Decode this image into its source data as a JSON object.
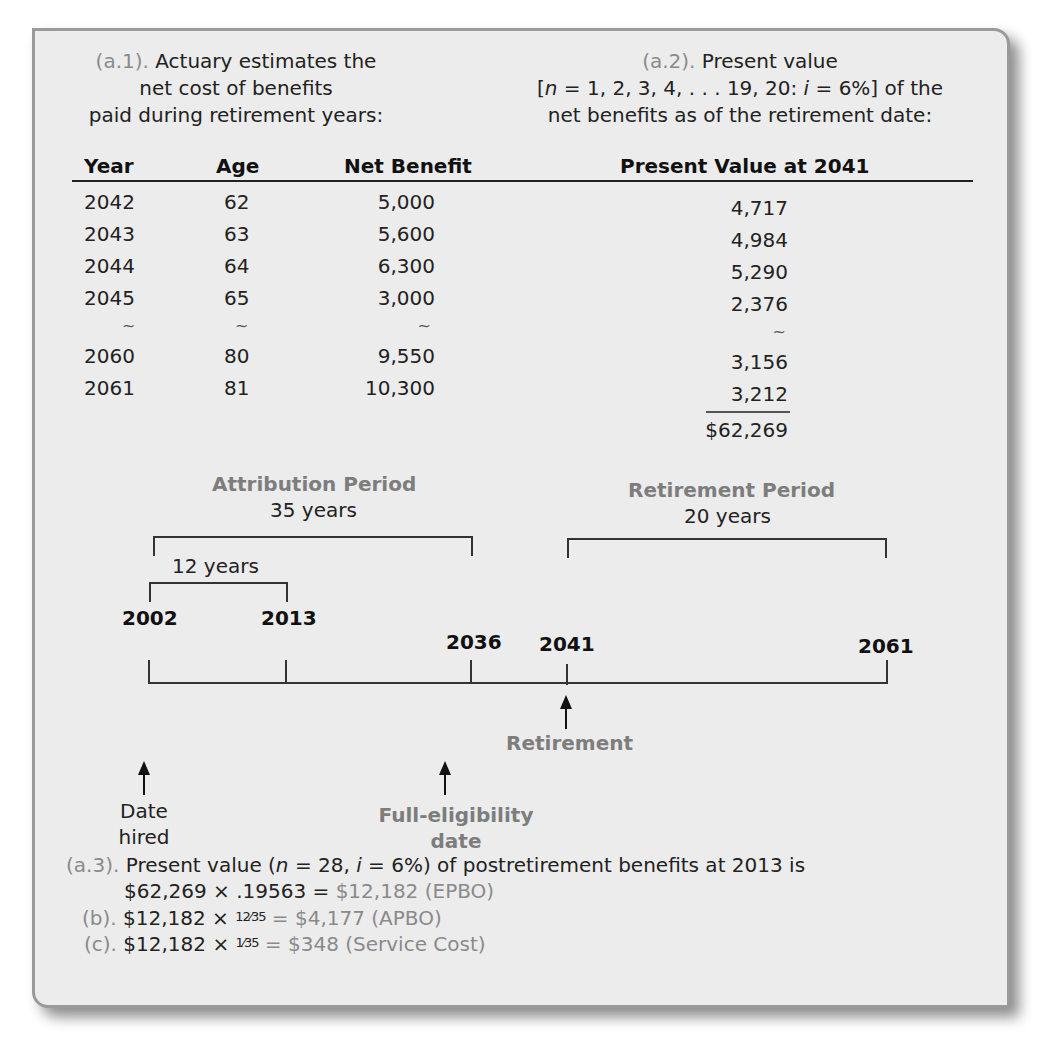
{
  "section_a1": {
    "label": "(a.1).",
    "lines": [
      "Actuary estimates the",
      "net cost of benefits",
      "paid during retirement years:"
    ]
  },
  "section_a2": {
    "label": "(a.2).",
    "line1": "Present value",
    "line2_prefix": "[",
    "line2_n": "n",
    "line2_mid": " = 1, 2, 3, 4, . . . 19, 20: ",
    "line2_i": "i",
    "line2_suffix": " = 6%] of the",
    "line3": "net benefits as of the retirement date:"
  },
  "table": {
    "headers": {
      "year": "Year",
      "age": "Age",
      "net_benefit": "Net Benefit",
      "present_value": "Present Value at 2041"
    },
    "rows": [
      {
        "year": "2042",
        "age": "62",
        "net_benefit": "5,000",
        "present_value": "4,717"
      },
      {
        "year": "2043",
        "age": "63",
        "net_benefit": "5,600",
        "present_value": "4,984"
      },
      {
        "year": "2044",
        "age": "64",
        "net_benefit": "6,300",
        "present_value": "5,290"
      },
      {
        "year": "2045",
        "age": "65",
        "net_benefit": "3,000",
        "present_value": "2,376"
      },
      {
        "year": "~",
        "age": "~",
        "net_benefit": "~",
        "present_value": "~"
      },
      {
        "year": "2060",
        "age": "80",
        "net_benefit": "9,550",
        "present_value": "3,156"
      },
      {
        "year": "2061",
        "age": "81",
        "net_benefit": "10,300",
        "present_value": "3,212"
      }
    ],
    "total": "$62,269"
  },
  "timeline": {
    "attribution": {
      "title": "Attribution Period",
      "length": "35 years"
    },
    "sub_period": {
      "length": "12 years"
    },
    "retirement_period": {
      "title": "Retirement Period",
      "length": "20 years"
    },
    "years": {
      "hire": "2002",
      "current": "2013",
      "full_eligibility": "2036",
      "retirement": "2041",
      "end": "2061"
    },
    "markers": {
      "date_hired": [
        "Date",
        "hired"
      ],
      "full_eligibility": [
        "Full-eligibility",
        "date"
      ],
      "retirement": "Retirement"
    }
  },
  "notes": {
    "a3": {
      "label": "(a.3).",
      "line1_prefix": "Present value (",
      "line1_n": "n",
      "line1_mid": " = 28, ",
      "line1_i": "i",
      "line1_suffix": " = 6%) of postretirement benefits at 2013 is",
      "line2_calc": "$62,269 × .19563 = ",
      "line2_result": "$12,182 (EPBO)"
    },
    "b": {
      "label": "(b).",
      "calc_prefix": "$12,182 × ",
      "fraction": "12⁄35",
      "result": " = $4,177 (APBO)"
    },
    "c": {
      "label": "(c).",
      "calc_prefix": "$12,182 × ",
      "fraction": "1⁄35",
      "result": " = $348 (Service Cost)"
    }
  }
}
